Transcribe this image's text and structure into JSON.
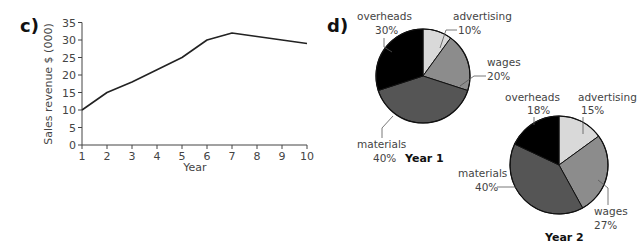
{
  "parts": {
    "c": "c)",
    "d": "d)"
  },
  "chart_data": [
    {
      "type": "line",
      "title": "",
      "xlabel": "Year",
      "ylabel": "Sales revenue $ (000)",
      "x": [
        1,
        2,
        3,
        4,
        5,
        6,
        7,
        8,
        9,
        10
      ],
      "series": [
        {
          "name": "Sales revenue",
          "values": [
            10,
            15,
            18,
            21.5,
            25,
            30,
            32,
            31,
            30,
            29
          ]
        }
      ],
      "xlim": [
        1,
        10
      ],
      "ylim": [
        0,
        35
      ],
      "yticks": [
        0,
        5,
        10,
        15,
        20,
        25,
        30,
        35
      ],
      "xticks": [
        1,
        2,
        3,
        4,
        5,
        6,
        7,
        8,
        9,
        10
      ],
      "grid": false,
      "color": "#222222"
    },
    {
      "type": "pie",
      "title": "Year 1",
      "labels": [
        "advertising",
        "wages",
        "materials",
        "overheads"
      ],
      "values": [
        10,
        20,
        40,
        30
      ],
      "value_labels": [
        "10%",
        "20%",
        "40%",
        "30%"
      ],
      "colors": [
        "#d9d9d9",
        "#8c8c8c",
        "#555555",
        "#000000"
      ]
    },
    {
      "type": "pie",
      "title": "Year 2",
      "labels": [
        "advertising",
        "wages",
        "materials",
        "overheads"
      ],
      "values": [
        15,
        27,
        40,
        18
      ],
      "value_labels": [
        "15%",
        "27%",
        "40%",
        "18%"
      ],
      "colors": [
        "#d9d9d9",
        "#8c8c8c",
        "#555555",
        "#000000"
      ]
    }
  ]
}
